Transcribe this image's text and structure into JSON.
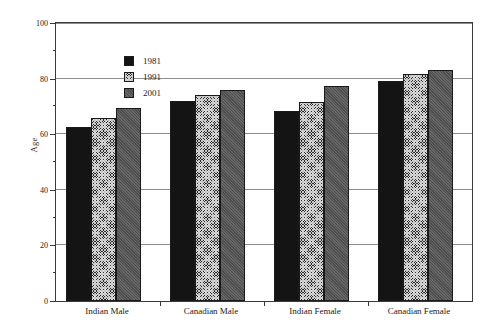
{
  "chart_data": {
    "type": "bar",
    "title": "",
    "subtitle": "",
    "xlabel": "",
    "ylabel": "Age",
    "ylim": [
      0,
      100
    ],
    "ytick_major": [
      0,
      20,
      40,
      60,
      80,
      100
    ],
    "ytick_minor": [
      10,
      30,
      50,
      70,
      90
    ],
    "ytick_labels": [
      "0",
      "20",
      "40",
      "60",
      "80",
      "100"
    ],
    "grid": "horizontal-major",
    "legend_position": "top-left-inside",
    "categories": [
      "Indian Male",
      "Canadian Male",
      "Indian Female",
      "Canadian Female"
    ],
    "series": [
      {
        "name": "1981",
        "color": "#141414",
        "pattern": "solid",
        "values": [
          62.5,
          72.0,
          68.5,
          79.0
        ]
      },
      {
        "name": "1991",
        "color": "#2c2c2c",
        "pattern": "cross-hatch",
        "values": [
          66.0,
          74.0,
          71.5,
          81.5
        ]
      },
      {
        "name": "2001",
        "color": "#565656",
        "pattern": "gray-fill",
        "values": [
          69.5,
          76.0,
          77.5,
          83.0
        ]
      }
    ]
  },
  "axis": {
    "frame_color": "#3a3a3a",
    "grid_color": "#8d8d8d"
  }
}
